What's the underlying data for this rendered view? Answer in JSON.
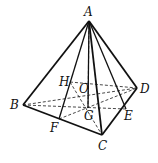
{
  "diagram": {
    "type": "geometry-pyramid",
    "points": {
      "A": {
        "label": "A",
        "x": 89,
        "y": 21
      },
      "B": {
        "label": "B",
        "x": 23,
        "y": 105
      },
      "C": {
        "label": "C",
        "x": 102,
        "y": 135
      },
      "D": {
        "label": "D",
        "x": 137,
        "y": 88
      },
      "H": {
        "label": "H",
        "x": 70,
        "y": 82
      },
      "O": {
        "label": "O",
        "x": 88,
        "y": 87
      },
      "G": {
        "label": "G",
        "x": 88,
        "y": 108
      },
      "E": {
        "label": "E",
        "x": 126,
        "y": 109
      },
      "F": {
        "label": "F",
        "x": 59,
        "y": 119
      }
    },
    "solid_edges": [
      "AB",
      "AC",
      "AD",
      "BC",
      "CD",
      "AF",
      "AG",
      "AE"
    ],
    "dashed_edges": [
      "BD",
      "BE",
      "HD",
      "HC",
      "FD",
      "AO"
    ]
  }
}
